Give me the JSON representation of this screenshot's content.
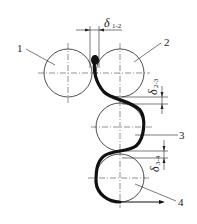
{
  "diagram": {
    "type": "roll-arrangement-schematic",
    "colors": {
      "line": "#222222",
      "strip": "#111111",
      "background": "#ffffff"
    },
    "rolls": [
      {
        "id": "1",
        "label": "1",
        "cx": 68,
        "cy": 73,
        "r": 24
      },
      {
        "id": "2",
        "label": "2",
        "cx": 120,
        "cy": 73,
        "r": 24
      },
      {
        "id": "3",
        "label": "3",
        "cx": 120,
        "cy": 127,
        "r": 24
      },
      {
        "id": "4",
        "label": "4",
        "cx": 120,
        "cy": 178,
        "r": 24
      }
    ],
    "gaps": [
      {
        "id": "d12",
        "symbol": "δ",
        "subscript": "1-2",
        "orientation": "horizontal"
      },
      {
        "id": "d23",
        "symbol": "δ",
        "subscript": "2-3",
        "orientation": "vertical"
      },
      {
        "id": "d34",
        "symbol": "δ",
        "subscript": "3-4",
        "orientation": "vertical"
      }
    ]
  }
}
